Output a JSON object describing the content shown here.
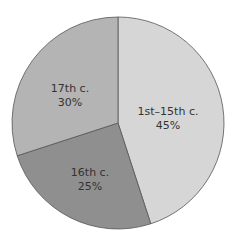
{
  "chart_data": {
    "type": "pie",
    "title": "",
    "categories": [
      "1st–15th c.",
      "16th c.",
      "17th c."
    ],
    "values": [
      45,
      25,
      30
    ],
    "labels": [
      "45%",
      "25%",
      "30%"
    ],
    "colors": [
      "#d6d6d6",
      "#8f8f8f",
      "#b4b4b4"
    ],
    "start_angle_deg": -90,
    "direction": "clockwise",
    "legend": "none (inline labels)"
  },
  "slices": [
    {
      "name": "1st–15th c.",
      "pct": "45%"
    },
    {
      "name": "16th c.",
      "pct": "25%"
    },
    {
      "name": "17th c.",
      "pct": "30%"
    }
  ]
}
